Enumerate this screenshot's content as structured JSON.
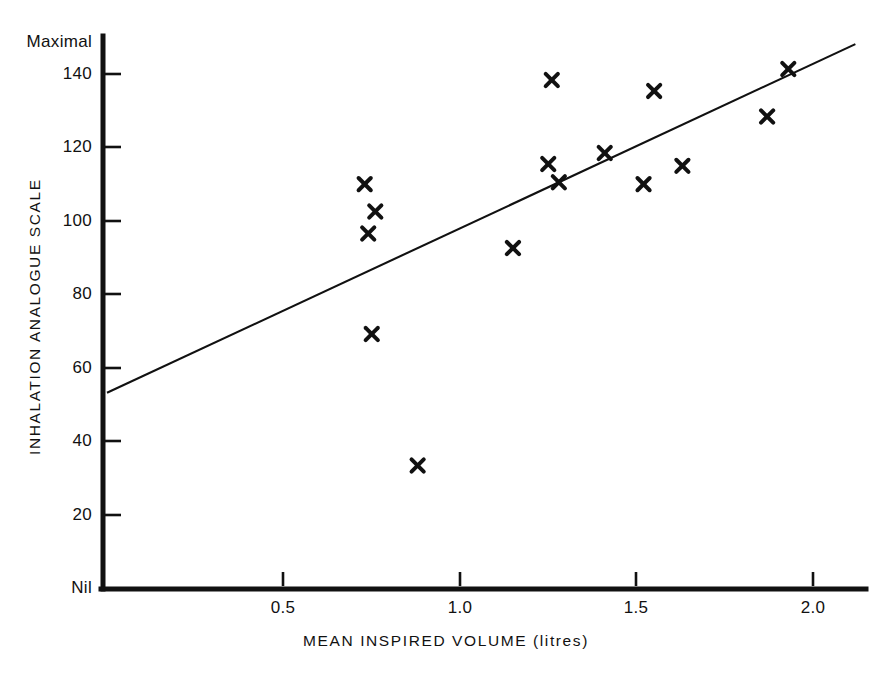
{
  "chart_data": {
    "type": "scatter",
    "title": "",
    "xlabel": "MEAN INSPIRED VOLUME  (litres)",
    "ylabel": "INHALATION ANALOGUE SCALE",
    "xlim": [
      0.0,
      2.23
    ],
    "ylim": [
      0,
      152
    ],
    "grid": false,
    "legend": null,
    "marker": "x",
    "marker_color": "#111111",
    "x_ticks": [
      0.5,
      1.0,
      1.5,
      2.0
    ],
    "x_tick_labels": [
      "0.5",
      "1.0",
      "1.5",
      "2.0"
    ],
    "y_ticks": [
      20,
      40,
      60,
      80,
      100,
      120,
      140
    ],
    "y_tick_labels": [
      "20",
      "40",
      "60",
      "80",
      "100",
      "120",
      "140"
    ],
    "y_axis_endpoint_labels": {
      "min": "Nil",
      "max": "Maximal"
    },
    "points": [
      {
        "x": 0.73,
        "y": 110.5
      },
      {
        "x": 0.76,
        "y": 103.0
      },
      {
        "x": 0.74,
        "y": 97.0
      },
      {
        "x": 0.75,
        "y": 69.5
      },
      {
        "x": 0.88,
        "y": 33.5
      },
      {
        "x": 1.15,
        "y": 93.0
      },
      {
        "x": 1.26,
        "y": 139.0
      },
      {
        "x": 1.25,
        "y": 116.0
      },
      {
        "x": 1.28,
        "y": 111.0
      },
      {
        "x": 1.41,
        "y": 119.0
      },
      {
        "x": 1.52,
        "y": 110.5
      },
      {
        "x": 1.55,
        "y": 136.0
      },
      {
        "x": 1.63,
        "y": 115.5
      },
      {
        "x": 1.87,
        "y": 129.0
      },
      {
        "x": 1.93,
        "y": 142.0
      }
    ],
    "fit_line": {
      "name": "regression line",
      "x_start": 0.0,
      "y_start": 53.4,
      "x_end": 2.12,
      "y_end": 148.8
    }
  }
}
